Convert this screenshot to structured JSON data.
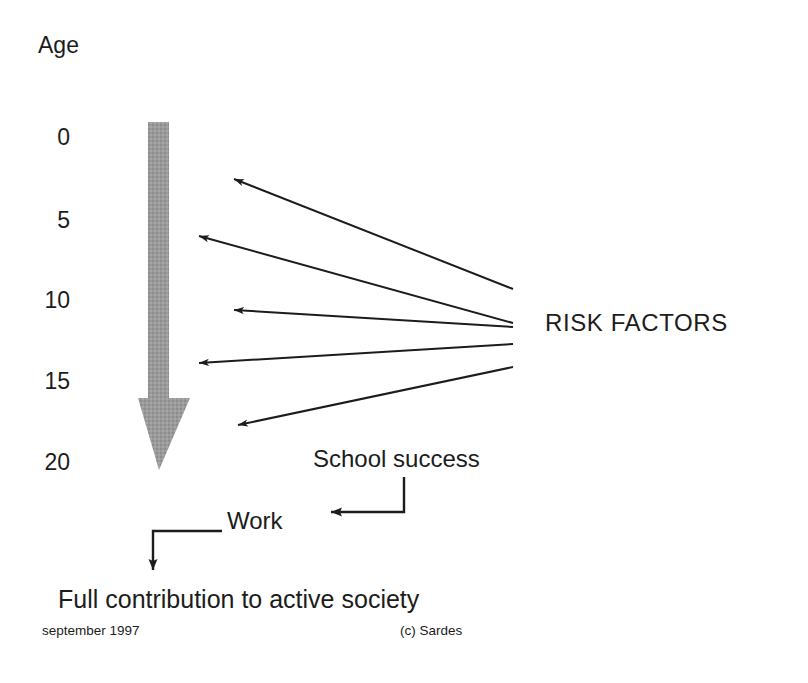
{
  "diagram": {
    "title_axis": "Age",
    "axis": {
      "name": "Age",
      "ticks": [
        "0",
        "5",
        "10",
        "15",
        "20"
      ],
      "unit": "years",
      "direction": "downward"
    },
    "nodes": {
      "risk_factors": "RISK FACTORS",
      "school_success": "School success",
      "work": "Work",
      "outcome": "Full contribution to active society"
    },
    "footer": {
      "date": "september 1997",
      "copyright": "(c) Sardes"
    },
    "colors": {
      "timeline_arrow": "#999999",
      "connector": "#1c1c1c",
      "text": "#1c1c1c",
      "background": "#ffffff"
    },
    "risk_arrows": [
      {
        "label": "risk-arrow-1",
        "target_age": "2",
        "tip_x": 228,
        "tip_y": 176,
        "origin_x": 513,
        "origin_y": 289
      },
      {
        "label": "risk-arrow-2",
        "target_age": "5",
        "tip_x": 193,
        "tip_y": 233,
        "origin_x": 513,
        "origin_y": 323
      },
      {
        "label": "risk-arrow-3",
        "target_age": "10",
        "tip_x": 228,
        "tip_y": 309,
        "origin_x": 513,
        "origin_y": 327
      },
      {
        "label": "risk-arrow-4",
        "target_age": "14",
        "tip_x": 193,
        "tip_y": 364,
        "origin_x": 513,
        "origin_y": 344
      },
      {
        "label": "risk-arrow-5",
        "target_age": "18",
        "tip_x": 232,
        "tip_y": 427,
        "origin_x": 513,
        "origin_y": 367
      }
    ]
  }
}
